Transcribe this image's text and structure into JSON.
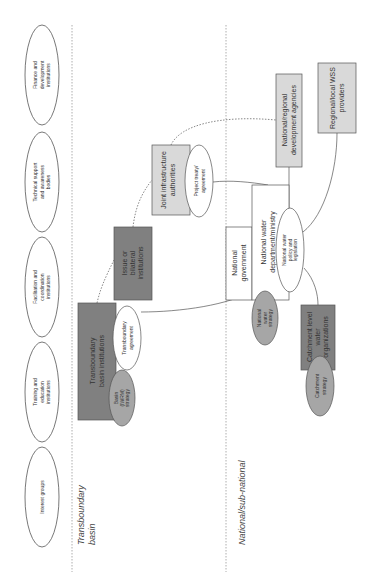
{
  "diagram": {
    "orientation": "rotated-90-ccw",
    "regions": {
      "transboundary": "Transboundary basin",
      "transboundary_line1": "Transboundary",
      "transboundary_line2": "basin",
      "national": "National/sub-national"
    },
    "stakeholders": [
      {
        "id": "finance",
        "lines": [
          "Finance and",
          "development",
          "institutions"
        ]
      },
      {
        "id": "technical",
        "lines": [
          "Technical support",
          "and awareness",
          "bodies"
        ]
      },
      {
        "id": "facilitation",
        "lines": [
          "Facilitation and",
          "coordination",
          "institutions"
        ]
      },
      {
        "id": "training",
        "lines": [
          "Training and",
          "education",
          "institutions"
        ]
      },
      {
        "id": "interest",
        "lines": [
          "Interest groups"
        ]
      }
    ],
    "nodes": {
      "tbi": {
        "lines": [
          "Transboundary",
          "basin institutions"
        ],
        "shape": "box",
        "fill": "#808080"
      },
      "basin_strategy": {
        "lines": [
          "Basin",
          "(IWRM)",
          "strategy"
        ],
        "shape": "ellipse",
        "fill": "#a6a6a6"
      },
      "tb_agreement": {
        "lines": [
          "Transboundary",
          "agreement"
        ],
        "shape": "ellipse",
        "fill": "#ffffff"
      },
      "issue_bilateral": {
        "lines": [
          "Issue or",
          "bilateral",
          "institutions"
        ],
        "shape": "box",
        "fill": "#808080"
      },
      "joint_infra": {
        "lines": [
          "Joint infrastructure",
          "authorities"
        ],
        "shape": "box",
        "fill": "#d9d9d9"
      },
      "project_treaty": {
        "lines": [
          "Project treaty/",
          "agreement"
        ],
        "shape": "ellipse",
        "fill": "#ffffff"
      },
      "nat_gov": {
        "lines": [
          "National",
          "government"
        ],
        "shape": "box",
        "fill": "#ffffff"
      },
      "nat_water_dept": {
        "lines": [
          "National water",
          "department/ministry"
        ],
        "shape": "box",
        "fill": "#ffffff"
      },
      "nat_policy": {
        "lines": [
          "National water",
          "policy and",
          "legislation"
        ],
        "shape": "ellipse",
        "fill": "#ffffff"
      },
      "nat_strategy": {
        "lines": [
          "National",
          "water",
          "strategy"
        ],
        "shape": "ellipse",
        "fill": "#a6a6a6"
      },
      "catchment_orgs": {
        "lines": [
          "Catchment level",
          "water",
          "organizations"
        ],
        "shape": "box",
        "fill": "#808080"
      },
      "catchment_strategy": {
        "lines": [
          "Catchment",
          "strategy"
        ],
        "shape": "ellipse",
        "fill": "#a6a6a6"
      },
      "nat_dev_agencies": {
        "lines": [
          "National/regional",
          "development agencies"
        ],
        "shape": "box",
        "fill": "#d9d9d9"
      },
      "wss_providers": {
        "lines": [
          "Regional/local WSS",
          "providers"
        ],
        "shape": "box",
        "fill": "#d9d9d9"
      }
    },
    "colors": {
      "stroke": "#555555",
      "divider": "#999999",
      "dark_box": "#808080",
      "light_box": "#d9d9d9",
      "strategy": "#a6a6a6"
    }
  }
}
